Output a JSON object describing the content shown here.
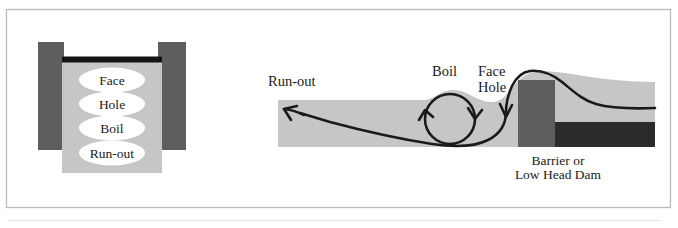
{
  "figure": {
    "frame": {
      "border_color": "#b4b4b4",
      "background": "#ffffff"
    },
    "colors": {
      "water": "#c6c6c6",
      "bank_dark": "#5e5e5e",
      "riverbed_dark": "#2b2b2b",
      "dam_black": "#111111",
      "line": "#1a1a1a",
      "ellipse_fill": "#ffffff",
      "text": "#1a1a1a"
    },
    "panels": [
      {
        "id": "plan-view",
        "name": "Plan view of low head dam",
        "zone_labels": [
          {
            "id": "face",
            "label": "Face"
          },
          {
            "id": "hole",
            "label": "Hole"
          },
          {
            "id": "boil",
            "label": "Boil"
          },
          {
            "id": "run-out",
            "label": "Run-out"
          }
        ]
      },
      {
        "id": "cross-section-view",
        "name": "Cross section of low head dam",
        "labels": [
          {
            "id": "run-out",
            "label": "Run-out"
          },
          {
            "id": "boil",
            "label": "Boil"
          },
          {
            "id": "face",
            "label": "Face"
          },
          {
            "id": "hole",
            "label": "Hole"
          }
        ],
        "caption": {
          "line1": "Barrier or",
          "line2": "Low Head Dam"
        }
      }
    ]
  }
}
